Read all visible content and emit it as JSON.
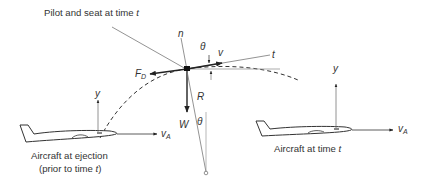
{
  "diagram": {
    "title_label": {
      "text": "Pilot and seat at time ",
      "var": "t"
    },
    "captions": {
      "left_aircraft_line1": "Aircraft at ejection",
      "left_aircraft_line2_prefix": "(prior to time ",
      "left_aircraft_line2_var": "t",
      "left_aircraft_line2_suffix": ")",
      "right_aircraft_prefix": "Aircraft at time ",
      "right_aircraft_var": "t"
    },
    "symbols": {
      "normal_axis": "n",
      "tangent_axis": "t",
      "velocity": "v",
      "angle": "θ",
      "angle_lower": "θ",
      "drag_main": "F",
      "drag_sub": "D",
      "weight": "W",
      "radius": "R",
      "y_left": "y",
      "y_right": "y",
      "va_left_main": "v",
      "va_left_sub": "A",
      "va_right_main": "v",
      "va_right_sub": "A"
    },
    "colors": {
      "ink": "#333333",
      "line": "#555555",
      "thin": "#888888"
    }
  }
}
